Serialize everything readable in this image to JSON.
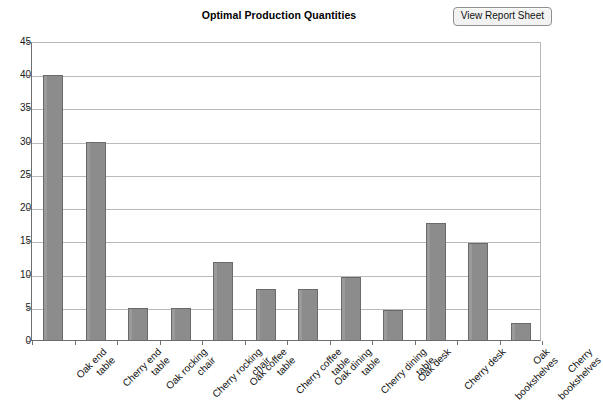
{
  "chart": {
    "title": "Optimal Production Quantities"
  },
  "toolbar": {
    "view_report_label": "View Report Sheet"
  },
  "chart_data": {
    "type": "bar",
    "title": "Optimal Production Quantities",
    "xlabel": "",
    "ylabel": "",
    "ylim": [
      0,
      45
    ],
    "ytick_step": 5,
    "yticks": [
      "45",
      "40",
      "35",
      "30",
      "25",
      "20",
      "15",
      "10",
      "5",
      "0"
    ],
    "grid": true,
    "legend": "none",
    "bar_color": "#8c8c8c",
    "bar_border_color": "#6a6a6a",
    "categories": [
      [
        "Oak end",
        "table"
      ],
      [
        "Cherry end",
        "table"
      ],
      [
        "Oak rocking",
        "chair"
      ],
      [
        "Cherry rocking",
        "chair"
      ],
      [
        "Oak coffee",
        "table"
      ],
      [
        "Cherry coffee",
        "table"
      ],
      [
        "Oak dining",
        "table"
      ],
      [
        "Cherry dining",
        "table"
      ],
      [
        "Oak desk"
      ],
      [
        "Cherry desk"
      ],
      [
        "Oak",
        "bookshelves"
      ],
      [
        "Cherry",
        "bookshelves"
      ]
    ],
    "values": [
      40,
      30,
      5,
      5,
      11.9,
      7.8,
      7.8,
      9.7,
      4.7,
      17.8,
      14.7,
      2.7
    ]
  }
}
